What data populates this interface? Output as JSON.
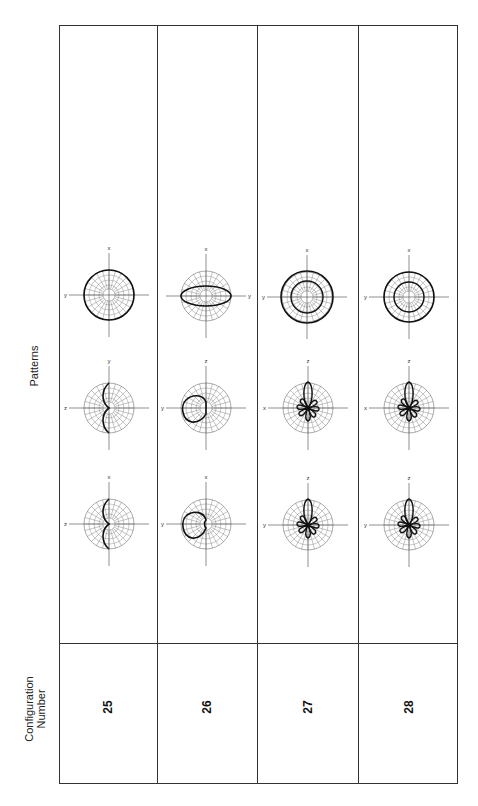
{
  "header": {
    "config_label_line1": "Configuration",
    "config_label_line2": "Number",
    "patterns_label": "Patterns"
  },
  "rows": [
    {
      "config": "25",
      "patterns": [
        {
          "top_label": "x",
          "side_label": "y",
          "side": "left",
          "shape": "circle-full"
        },
        {
          "top_label": "y",
          "side_label": "z",
          "side": "left",
          "shape": "half-lobes"
        },
        {
          "top_label": "x",
          "side_label": "z",
          "side": "left",
          "shape": "half-lobes"
        }
      ]
    },
    {
      "config": "26",
      "patterns": [
        {
          "top_label": "x",
          "side_label": "y",
          "side": "right",
          "shape": "ellipse"
        },
        {
          "top_label": "z",
          "side_label": "y",
          "side": "left",
          "shape": "offset-circle"
        },
        {
          "top_label": "x",
          "side_label": "y",
          "side": "left",
          "shape": "offset-cardioid"
        }
      ]
    },
    {
      "config": "27",
      "patterns": [
        {
          "top_label": "x",
          "side_label": "y",
          "side": "left",
          "shape": "double-circle"
        },
        {
          "top_label": "z",
          "side_label": "x",
          "side": "left",
          "shape": "multi-lobe"
        },
        {
          "top_label": "z",
          "side_label": "y",
          "side": "left",
          "shape": "multi-lobe"
        }
      ]
    },
    {
      "config": "28",
      "patterns": [
        {
          "top_label": "x",
          "side_label": "y",
          "side": "left",
          "shape": "double-circle"
        },
        {
          "top_label": "z",
          "side_label": "x",
          "side": "left",
          "shape": "multi-lobe"
        },
        {
          "top_label": "z",
          "side_label": "y",
          "side": "left",
          "shape": "multi-lobe"
        }
      ]
    }
  ]
}
